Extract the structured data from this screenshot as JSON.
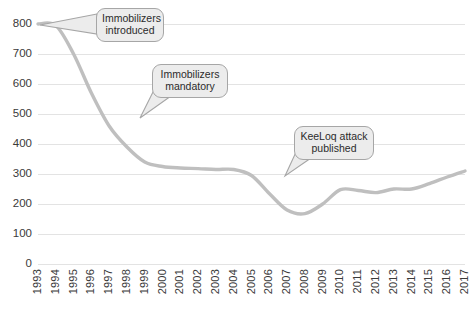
{
  "chart_data": {
    "type": "line",
    "title": "",
    "xlabel": "",
    "ylabel": "",
    "xlim": [
      1993,
      2017
    ],
    "ylim": [
      0,
      800
    ],
    "grid": true,
    "legend_position": "none",
    "line_color": "#bfbfbf",
    "x": [
      1993,
      1994,
      1995,
      1996,
      1997,
      1998,
      1999,
      2000,
      2001,
      2002,
      2003,
      2004,
      2005,
      2006,
      2007,
      2008,
      2009,
      2010,
      2011,
      2012,
      2013,
      2014,
      2015,
      2016,
      2017
    ],
    "values": [
      800,
      795,
      700,
      570,
      460,
      390,
      340,
      325,
      320,
      318,
      315,
      315,
      295,
      235,
      180,
      168,
      200,
      248,
      245,
      238,
      250,
      250,
      268,
      290,
      310
    ],
    "yticks": [
      0,
      100,
      200,
      300,
      400,
      500,
      600,
      700,
      800
    ],
    "ytick_labels": [
      "0",
      "100",
      "200",
      "300",
      "400",
      "500",
      "600",
      "700",
      "800"
    ],
    "xtick_labels": [
      "1993",
      "1994",
      "1995",
      "1996",
      "1997",
      "1998",
      "1999",
      "2000",
      "2001",
      "2002",
      "2003",
      "2004",
      "2005",
      "2006",
      "2007",
      "2008",
      "2009",
      "2010",
      "2011",
      "2012",
      "2013",
      "2014",
      "2015",
      "2016",
      "2017"
    ],
    "annotations": [
      {
        "id": "immobilizers-introduced",
        "line1": "Immobilizers",
        "line2": "introduced",
        "target_x": 1993,
        "target_y": 800
      },
      {
        "id": "immobilizers-mandatory",
        "line1": "Immobilizers",
        "line2": "mandatory",
        "target_x": 1997,
        "target_y": 510
      },
      {
        "id": "keeloq-attack-published",
        "line1": "KeeLoq attack",
        "line2": "published",
        "target_x": 2007,
        "target_y": 320
      }
    ]
  }
}
